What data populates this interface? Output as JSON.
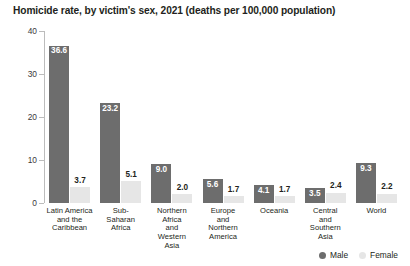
{
  "chart_data": {
    "type": "bar",
    "title": "Homicide rate, by victim's sex, 2021 (deaths per 100,000 population)",
    "xlabel": "",
    "ylabel": "",
    "ylim": [
      0,
      40
    ],
    "yticks": [
      0,
      10,
      20,
      30,
      40
    ],
    "ytick_labels": [
      "0",
      "10",
      "20",
      "30",
      "40"
    ],
    "grid": false,
    "legend_position": "bottom-right",
    "categories": [
      "Latin America and the Caribbean",
      "Sub-Saharan Africa",
      "Northern Africa and Western Asia",
      "Europe and Northern America",
      "Oceania",
      "Central and Southern Asia",
      "World"
    ],
    "category_lines": [
      [
        "Latin America",
        "and the",
        "Caribbean"
      ],
      [
        "Sub-",
        "Saharan",
        "Africa"
      ],
      [
        "Northern",
        "Africa",
        "and",
        "Western",
        "Asia"
      ],
      [
        "Europe",
        "and",
        "Northern",
        "America"
      ],
      [
        "Oceania"
      ],
      [
        "Central",
        "and",
        "Southern",
        "Asia"
      ],
      [
        "World"
      ]
    ],
    "series": [
      {
        "name": "Male",
        "color": "#6d6d6d",
        "values": [
          36.6,
          23.2,
          9.0,
          5.6,
          4.1,
          3.5,
          9.3
        ],
        "value_labels": [
          "36.6",
          "23.2",
          "9.0",
          "5.6",
          "4.1",
          "3.5",
          "9.3"
        ]
      },
      {
        "name": "Female",
        "color": "#e6e6e6",
        "values": [
          3.7,
          5.1,
          2.0,
          1.7,
          1.7,
          2.4,
          2.2
        ],
        "value_labels": [
          "3.7",
          "5.1",
          "2.0",
          "1.7",
          "1.7",
          "2.4",
          "2.2"
        ]
      }
    ]
  },
  "legend": {
    "items": [
      {
        "label": "Male",
        "color": "#6d6d6d"
      },
      {
        "label": "Female",
        "color": "#e6e6e6"
      }
    ]
  }
}
